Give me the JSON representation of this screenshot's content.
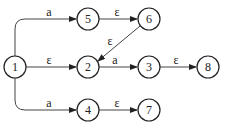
{
  "diagram": {
    "type": "nfa-state-diagram",
    "nodes": [
      {
        "id": "1",
        "label": "1",
        "x": 15,
        "y": 67
      },
      {
        "id": "5",
        "label": "5",
        "x": 88,
        "y": 19
      },
      {
        "id": "6",
        "label": "6",
        "x": 149,
        "y": 19
      },
      {
        "id": "2",
        "label": "2",
        "x": 88,
        "y": 67
      },
      {
        "id": "3",
        "label": "3",
        "x": 149,
        "y": 67
      },
      {
        "id": "8",
        "label": "8",
        "x": 208,
        "y": 67
      },
      {
        "id": "4",
        "label": "4",
        "x": 88,
        "y": 110
      },
      {
        "id": "7",
        "label": "7",
        "x": 149,
        "y": 110
      }
    ],
    "edges": [
      {
        "from": "1",
        "to": "5",
        "label": "a"
      },
      {
        "from": "1",
        "to": "2",
        "label": "ε"
      },
      {
        "from": "1",
        "to": "4",
        "label": "a"
      },
      {
        "from": "5",
        "to": "6",
        "label": "ε"
      },
      {
        "from": "6",
        "to": "2",
        "label": "ε"
      },
      {
        "from": "2",
        "to": "3",
        "label": "a"
      },
      {
        "from": "3",
        "to": "8",
        "label": "ε"
      },
      {
        "from": "4",
        "to": "7",
        "label": "ε"
      }
    ]
  }
}
